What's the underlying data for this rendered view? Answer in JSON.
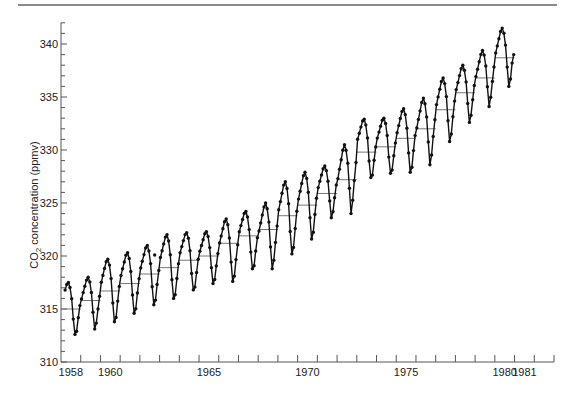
{
  "chart_data": {
    "type": "line",
    "title": "",
    "xlabel": "",
    "ylabel": "CO2 concentration (ppmv)",
    "ylabel_parts": {
      "prefix": "CO",
      "subscript": "2",
      "suffix": " concentration (ppmv)"
    },
    "ylim": [
      310,
      342
    ],
    "xlim": [
      1958,
      1983
    ],
    "grid": false,
    "legend": null,
    "y_ticks": [
      310,
      315,
      320,
      325,
      330,
      335,
      340
    ],
    "x_tick_labels": [
      {
        "label": "1958",
        "year": 1958
      },
      {
        "label": "1960",
        "year": 1960
      },
      {
        "label": "1965",
        "year": 1965
      },
      {
        "label": "1970",
        "year": 1970
      },
      {
        "label": "1975",
        "year": 1975
      },
      {
        "label": "1980",
        "year": 1980
      },
      {
        "label": "1981",
        "year": 1981
      }
    ],
    "series": [
      {
        "name": "Monthly mean CO2 (Mauna Loa)",
        "style": "line-with-markers",
        "start": "1958-03",
        "end": "1980-12",
        "annual": [
          {
            "year": 1958,
            "peak": 317.5,
            "trough": 312.6,
            "mean": 315.0
          },
          {
            "year": 1959,
            "peak": 318.0,
            "trough": 313.1,
            "mean": 315.8
          },
          {
            "year": 1960,
            "peak": 319.7,
            "trough": 313.8,
            "mean": 316.7
          },
          {
            "year": 1961,
            "peak": 320.3,
            "trough": 314.6,
            "mean": 317.4
          },
          {
            "year": 1962,
            "peak": 321.0,
            "trough": 315.4,
            "mean": 318.3
          },
          {
            "year": 1963,
            "peak": 322.0,
            "trough": 316.0,
            "mean": 318.9
          },
          {
            "year": 1964,
            "peak": 322.2,
            "trough": 316.8,
            "mean": 319.6
          },
          {
            "year": 1965,
            "peak": 322.3,
            "trough": 317.4,
            "mean": 320.0
          },
          {
            "year": 1966,
            "peak": 323.5,
            "trough": 317.6,
            "mean": 321.2
          },
          {
            "year": 1967,
            "peak": 324.2,
            "trough": 318.8,
            "mean": 321.9
          },
          {
            "year": 1968,
            "peak": 325.0,
            "trough": 318.8,
            "mean": 322.5
          },
          {
            "year": 1969,
            "peak": 327.0,
            "trough": 320.2,
            "mean": 323.8
          },
          {
            "year": 1970,
            "peak": 327.9,
            "trough": 321.6,
            "mean": 324.8
          },
          {
            "year": 1971,
            "peak": 328.5,
            "trough": 323.6,
            "mean": 325.9
          },
          {
            "year": 1972,
            "peak": 330.5,
            "trough": 324.0,
            "mean": 327.2
          },
          {
            "year": 1973,
            "peak": 332.9,
            "trough": 327.4,
            "mean": 329.8
          },
          {
            "year": 1974,
            "peak": 333.0,
            "trough": 327.8,
            "mean": 330.3
          },
          {
            "year": 1975,
            "peak": 333.9,
            "trough": 327.9,
            "mean": 331.1
          },
          {
            "year": 1976,
            "peak": 334.9,
            "trough": 328.6,
            "mean": 332.0
          },
          {
            "year": 1977,
            "peak": 336.8,
            "trough": 330.8,
            "mean": 333.8
          },
          {
            "year": 1978,
            "peak": 338.0,
            "trough": 332.6,
            "mean": 335.4
          },
          {
            "year": 1979,
            "peak": 339.4,
            "trough": 334.1,
            "mean": 336.8
          },
          {
            "year": 1980,
            "peak": 341.5,
            "trough": 336.0,
            "mean": 338.7
          }
        ],
        "final_value": 339.0
      },
      {
        "name": "Annual mean",
        "style": "horizontal-segments"
      }
    ],
    "outliers": [
      {
        "x": 1962.75,
        "y": 320.1
      }
    ]
  }
}
